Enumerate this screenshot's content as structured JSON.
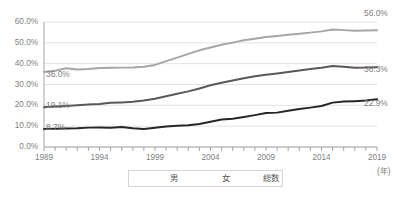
{
  "chart_data": {
    "type": "line",
    "title": "",
    "xlabel": "(年)",
    "ylabel": "",
    "xlim": [
      1989,
      2019
    ],
    "ylim": [
      0,
      60
    ],
    "grid": true,
    "legend_position": "bottom",
    "x": [
      1989,
      1990,
      1991,
      1992,
      1993,
      1994,
      1995,
      1996,
      1997,
      1998,
      1999,
      2000,
      2001,
      2002,
      2003,
      2004,
      2005,
      2006,
      2007,
      2008,
      2009,
      2010,
      2011,
      2012,
      2013,
      2014,
      2015,
      2016,
      2017,
      2018,
      2019
    ],
    "x_tick_labels": [
      "1989",
      "1994",
      "1999",
      "2004",
      "2009",
      "2014",
      "2019"
    ],
    "y_tick_labels": [
      "0.0%",
      "10.0%",
      "20.0%",
      "30.0%",
      "40.0%",
      "50.0%",
      "60.0%"
    ],
    "y_ticks": [
      0,
      10,
      20,
      30,
      40,
      50,
      60
    ],
    "series": [
      {
        "name": "男",
        "color": "#262626",
        "start_label": "8.7%",
        "end_label": "22.9%",
        "values": [
          8.7,
          8.8,
          8.9,
          9.0,
          9.3,
          9.4,
          9.2,
          9.6,
          9.0,
          8.6,
          9.2,
          9.8,
          10.2,
          10.4,
          11.0,
          12.1,
          13.2,
          13.6,
          14.4,
          15.3,
          16.3,
          16.5,
          17.4,
          18.2,
          18.9,
          19.7,
          21.3,
          21.8,
          22.0,
          22.3,
          22.9
        ]
      },
      {
        "name": "女",
        "color": "#595959",
        "start_label": "19.1%",
        "end_label": "38.3%",
        "values": [
          19.1,
          19.4,
          19.7,
          20.0,
          20.4,
          20.6,
          21.2,
          21.4,
          21.7,
          22.3,
          23.2,
          24.4,
          25.6,
          26.7,
          28.1,
          29.6,
          30.8,
          31.9,
          33.0,
          34.0,
          34.7,
          35.3,
          36.0,
          36.7,
          37.4,
          38.0,
          38.9,
          38.5,
          38.0,
          38.1,
          38.3
        ]
      },
      {
        "name": "総数",
        "color": "#a6a6a6",
        "start_label": "36.0%",
        "end_label": "56.0%",
        "values": [
          36.0,
          36.6,
          37.8,
          37.2,
          37.4,
          37.9,
          38.0,
          38.1,
          38.2,
          38.5,
          39.4,
          41.2,
          42.9,
          44.7,
          46.4,
          47.8,
          49.1,
          50.1,
          51.2,
          52.0,
          52.8,
          53.3,
          53.9,
          54.4,
          54.9,
          55.5,
          56.4,
          56.1,
          55.8,
          55.9,
          56.0
        ]
      }
    ]
  },
  "axis": {
    "unit": "(年)"
  },
  "legend": {
    "items": [
      {
        "label": "男"
      },
      {
        "label": "女"
      },
      {
        "label": "総数"
      }
    ]
  }
}
